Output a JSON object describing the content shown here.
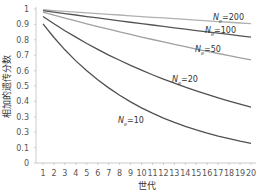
{
  "chart_data": {
    "type": "line",
    "title": "",
    "xlabel": "世代",
    "ylabel": "相加的遗传分数",
    "x": [
      1,
      2,
      3,
      4,
      5,
      6,
      7,
      8,
      9,
      10,
      11,
      12,
      13,
      14,
      15,
      16,
      17,
      18,
      19,
      20
    ],
    "xticks": [
      "1",
      "2",
      "3",
      "4",
      "5",
      "6",
      "7",
      "8",
      "9",
      "10",
      "11",
      "12",
      "13",
      "14",
      "15",
      "16",
      "17",
      "18",
      "19",
      "20"
    ],
    "ylim": [
      0,
      1
    ],
    "yticks": [
      "0",
      "0.1",
      "0.3",
      "0.3",
      "0.4",
      "0.5",
      "0.6",
      "0.7",
      "0.8",
      "0.9",
      "1"
    ],
    "grid": false,
    "legend_position": "inline-labels",
    "series": [
      {
        "name": "Ne=200",
        "label_main": "N",
        "label_sub": "e",
        "label_rest": "=200",
        "color": "#b0b0b0",
        "values": [
          0.995,
          0.99,
          0.985,
          0.98,
          0.975,
          0.97,
          0.965,
          0.961,
          0.956,
          0.951,
          0.946,
          0.942,
          0.937,
          0.932,
          0.928,
          0.923,
          0.918,
          0.914,
          0.909,
          0.905
        ]
      },
      {
        "name": "Ne=100",
        "label_main": "N",
        "label_sub": "e",
        "label_rest": "=100",
        "color": "#555555",
        "values": [
          0.99,
          0.98,
          0.97,
          0.961,
          0.951,
          0.942,
          0.932,
          0.923,
          0.914,
          0.905,
          0.896,
          0.887,
          0.878,
          0.869,
          0.86,
          0.852,
          0.843,
          0.835,
          0.826,
          0.818
        ]
      },
      {
        "name": "Ne=50",
        "label_main": "N",
        "label_sub": "e",
        "label_rest": "=50",
        "color": "#a0a0a0",
        "values": [
          0.98,
          0.961,
          0.941,
          0.923,
          0.904,
          0.886,
          0.869,
          0.851,
          0.835,
          0.818,
          0.802,
          0.786,
          0.77,
          0.755,
          0.74,
          0.725,
          0.711,
          0.697,
          0.683,
          0.669
        ]
      },
      {
        "name": "Ne=20",
        "label_main": "N",
        "label_sub": "e",
        "label_rest": "=20",
        "color": "#505050",
        "values": [
          0.951,
          0.904,
          0.859,
          0.817,
          0.776,
          0.738,
          0.701,
          0.667,
          0.634,
          0.603,
          0.573,
          0.545,
          0.518,
          0.492,
          0.468,
          0.445,
          0.423,
          0.402,
          0.382,
          0.363
        ]
      },
      {
        "name": "Ne=10",
        "label_main": "N",
        "label_sub": "e",
        "label_rest": "=10",
        "color": "#505050",
        "values": [
          0.903,
          0.815,
          0.735,
          0.663,
          0.599,
          0.54,
          0.488,
          0.44,
          0.397,
          0.358,
          0.324,
          0.292,
          0.264,
          0.238,
          0.215,
          0.194,
          0.175,
          0.158,
          0.142,
          0.128
        ]
      }
    ]
  }
}
